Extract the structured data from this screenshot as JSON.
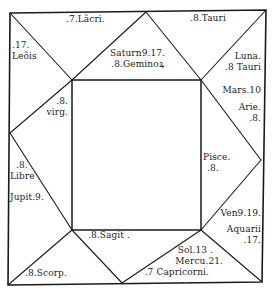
{
  "diagram": {
    "type": "square horoscope chart (figura coeli)",
    "colors": {
      "ink": "#1a1a1a",
      "paper": "#ffffff"
    },
    "houses": {
      "top_left_corner": {
        "lines": [
          ".17.",
          "Leõis"
        ]
      },
      "top_left_edge": {
        "lines": [
          ".7.Lãcri."
        ]
      },
      "top_center": {
        "lines": [
          "Saturn9.17.",
          ".8.Geminoꝝ"
        ]
      },
      "top_right_edge": {
        "lines": [
          ".8.Tauri"
        ]
      },
      "top_right_corner": {
        "lines": [
          "Luna.",
          ".8 Tauri"
        ]
      },
      "right_upper": {
        "lines": [
          "Mars.10",
          "Arie.",
          ".8."
        ]
      },
      "left_upper": {
        "lines": [
          ".8.",
          "virg."
        ]
      },
      "left_lower": {
        "lines": [
          ".8.",
          "Libre",
          "Jupit.9."
        ]
      },
      "right_lower": {
        "lines": [
          "Pisce.",
          ".8."
        ]
      },
      "bottom_left_corner": {
        "lines": [
          ".8.Scorp."
        ]
      },
      "bottom_center": {
        "lines": [
          ".8.Sagit ."
        ]
      },
      "bottom_center_lower": {
        "lines": [
          "Sol.13 .",
          "Mercu.21.",
          ".7 Capricorni."
        ]
      },
      "bottom_right_corner": {
        "lines": [
          "Ven9.19.",
          "Aquarii",
          ".17."
        ]
      }
    }
  }
}
